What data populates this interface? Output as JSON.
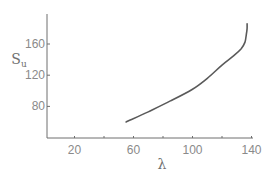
{
  "chart_data": {
    "type": "line",
    "title": "",
    "xlabel": "λ",
    "ylabel": "S_u",
    "ylabel_main": "S",
    "ylabel_sub": "u",
    "xlim": [
      0,
      145
    ],
    "ylim": [
      40,
      195
    ],
    "xticks": [
      20,
      40,
      60,
      80,
      100,
      120,
      140
    ],
    "xtick_labels": [
      "20",
      "",
      "60",
      "",
      "100",
      "",
      "140"
    ],
    "yticks": [
      80,
      120,
      160
    ],
    "ytick_labels": [
      "80",
      "120",
      "160"
    ],
    "grid": false,
    "legend": null,
    "series": [
      {
        "name": "S_u vs λ",
        "x": [
          55,
          70,
          85,
          100,
          110,
          120,
          128,
          133,
          135.5,
          136.5,
          137,
          137
        ],
        "y": [
          60,
          73,
          87,
          102,
          116,
          133,
          145,
          154,
          162,
          172,
          180,
          186
        ]
      }
    ],
    "colors": {
      "line": "#5a5a5a",
      "axis": "#6e6e6e",
      "text": "#8a8a8a"
    }
  }
}
